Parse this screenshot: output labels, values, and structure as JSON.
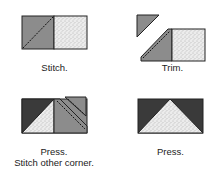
{
  "steps": [
    {
      "label": "Stitch."
    },
    {
      "label": "Trim."
    },
    {
      "label_line1": "Press.",
      "label_line2": "Stitch other corner."
    },
    {
      "label": "Press."
    }
  ],
  "colors": {
    "medium_gray": "#8c8c8c",
    "dark_gray": "#3a3a3a",
    "stipple_bg": "#e8e8e8",
    "outline": "#222222"
  }
}
